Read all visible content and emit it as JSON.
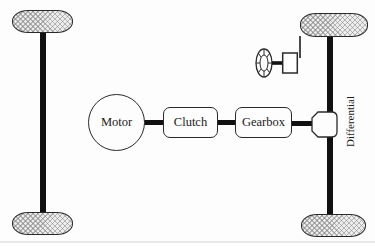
{
  "diagram": {
    "type": "vehicle-drivetrain-schematic",
    "labels": {
      "motor": "Motor",
      "clutch": "Clutch",
      "gearbox": "Gearbox",
      "differential": "Differential"
    },
    "symbols": [
      "tire-front-left",
      "tire-rear-left",
      "tire-front-right",
      "tire-rear-right",
      "left-axle",
      "right-axle",
      "steering-wheel",
      "steering-column-box",
      "drive-shaft-motor-clutch",
      "drive-shaft-clutch-gearbox",
      "drive-shaft-gearbox-differential",
      "differential-housing"
    ],
    "colors": {
      "background": "#fdfdfd",
      "outline": "#2a2a2a",
      "shaft": "#111111",
      "tire_fill": "#ededed",
      "tire_hatch": "#9a9a9a",
      "box_fill": "#fdfdfd",
      "text": "#1a1a1a"
    }
  }
}
